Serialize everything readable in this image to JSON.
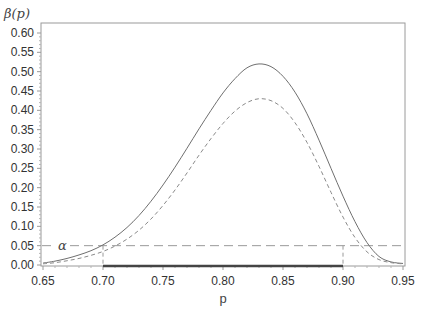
{
  "chart_data": {
    "type": "line",
    "title": "",
    "xlabel": "p",
    "ylabel": "β(p)",
    "xlim": [
      0.65,
      0.95
    ],
    "ylim": [
      0.0,
      0.6
    ],
    "x_ticks": [
      "0.65",
      "0.70",
      "0.75",
      "0.80",
      "0.85",
      "0.90",
      "0.95"
    ],
    "y_ticks": [
      "0.00",
      "0.05",
      "0.10",
      "0.15",
      "0.20",
      "0.25",
      "0.30",
      "0.35",
      "0.40",
      "0.45",
      "0.50",
      "0.55",
      "0.60"
    ],
    "grid": false,
    "legend": null,
    "x": [
      0.65,
      0.66,
      0.67,
      0.68,
      0.69,
      0.7,
      0.71,
      0.72,
      0.73,
      0.74,
      0.75,
      0.76,
      0.77,
      0.78,
      0.79,
      0.8,
      0.81,
      0.82,
      0.83,
      0.84,
      0.85,
      0.86,
      0.87,
      0.88,
      0.89,
      0.9,
      0.91,
      0.92,
      0.93,
      0.94,
      0.95
    ],
    "series": [
      {
        "name": "beta_solid",
        "style": "solid",
        "values": [
          0.005,
          0.01,
          0.017,
          0.026,
          0.037,
          0.052,
          0.072,
          0.097,
          0.128,
          0.165,
          0.207,
          0.253,
          0.302,
          0.352,
          0.4,
          0.445,
          0.482,
          0.51,
          0.52,
          0.513,
          0.488,
          0.447,
          0.391,
          0.323,
          0.25,
          0.178,
          0.112,
          0.058,
          0.022,
          0.008,
          0.004
        ]
      },
      {
        "name": "beta_dashed",
        "style": "dashed",
        "values": [
          0.003,
          0.006,
          0.011,
          0.017,
          0.025,
          0.035,
          0.049,
          0.067,
          0.09,
          0.119,
          0.154,
          0.194,
          0.238,
          0.284,
          0.327,
          0.366,
          0.398,
          0.42,
          0.43,
          0.425,
          0.405,
          0.368,
          0.317,
          0.255,
          0.188,
          0.124,
          0.071,
          0.034,
          0.014,
          0.006,
          0.003
        ]
      }
    ],
    "annotations": [
      {
        "type": "hline",
        "y": 0.05,
        "style": "dashed",
        "label": "α"
      },
      {
        "type": "vline",
        "x": 0.7,
        "y_from": 0.0,
        "y_to": 0.05,
        "style": "dashed"
      },
      {
        "type": "vline",
        "x": 0.9,
        "y_from": 0.0,
        "y_to": 0.05,
        "style": "dashed"
      },
      {
        "type": "segment",
        "x_from": 0.7,
        "x_to": 0.9,
        "y": 0.0,
        "style": "thick",
        "label": ""
      }
    ]
  },
  "colors": {
    "frame": "#9a9a9a",
    "solid_curve": "#6f6f6f",
    "dashed_curve": "#8a8a8a",
    "alpha_line": "#9a9a9a",
    "interval_segment": "#444444",
    "text": "#333333"
  }
}
